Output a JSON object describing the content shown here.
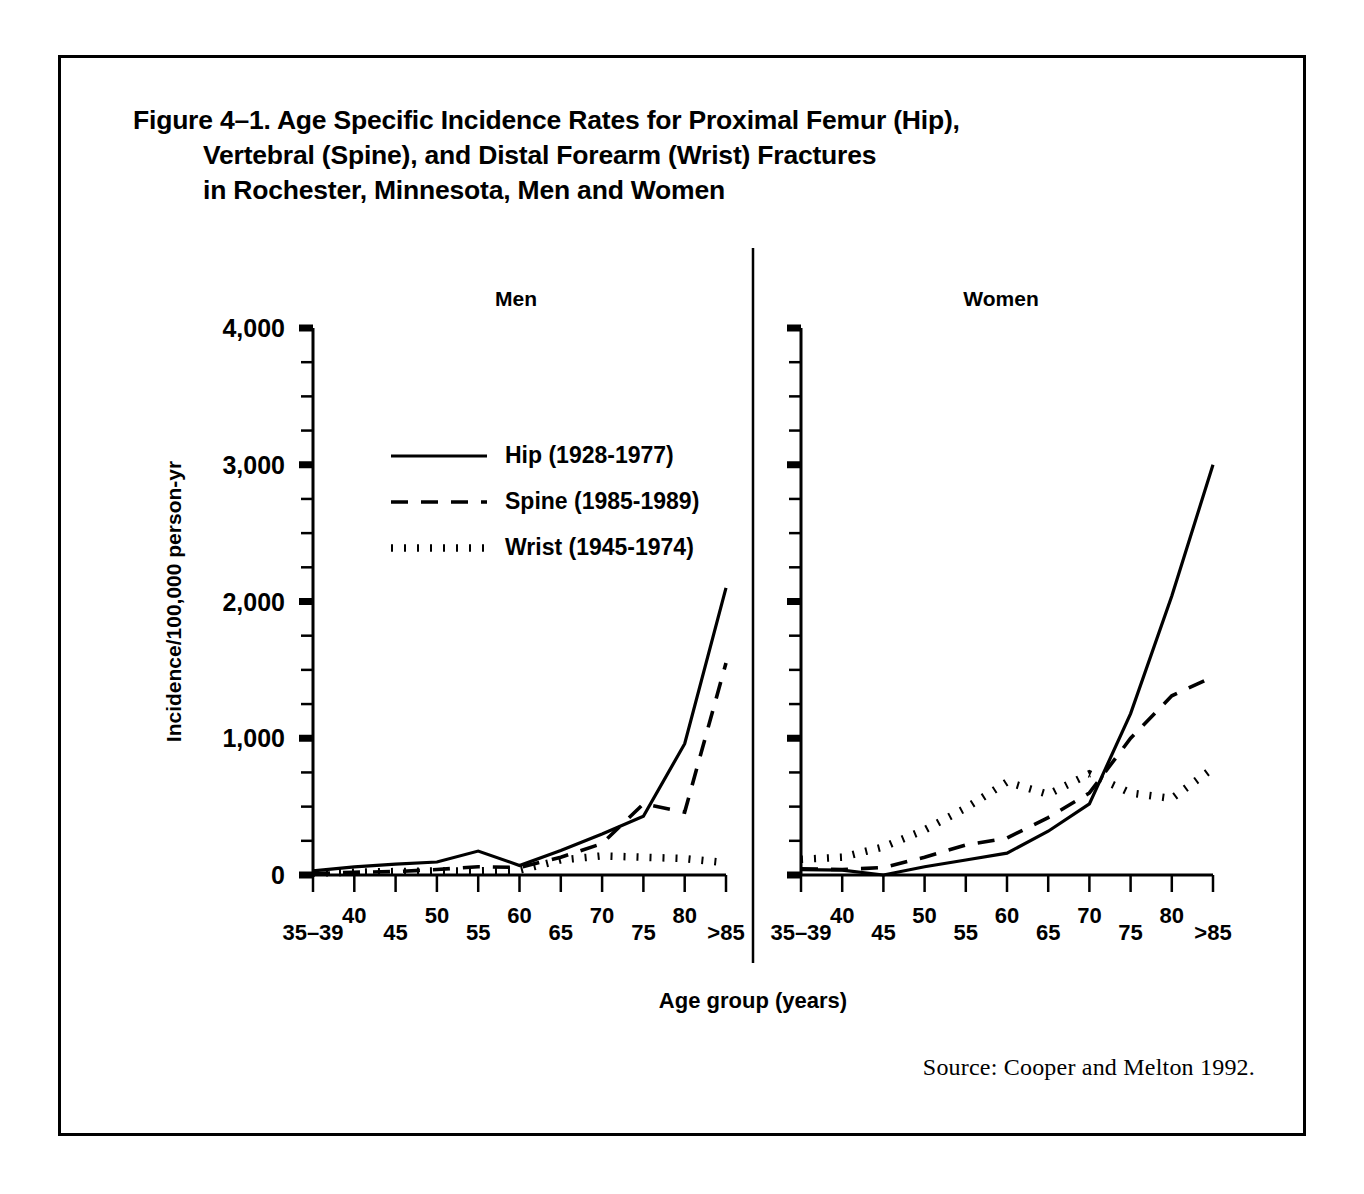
{
  "figure": {
    "title_lines": [
      "Figure 4–1. Age Specific Incidence Rates for Proximal Femur (Hip),",
      "Vertebral (Spine), and Distal Forearm (Wrist) Fractures",
      "in Rochester, Minnesota, Men and Women"
    ],
    "source": "Source: Cooper and Melton 1992."
  },
  "chart_data": {
    "type": "line",
    "title": "Figure 4–1. Age Specific Incidence Rates for Proximal Femur (Hip), Vertebral (Spine), and Distal Forearm (Wrist) Fractures in Rochester, Minnesota, Men and Women",
    "xlabel": "Age group (years)",
    "ylabel": "Incidence/100,000 person-yr",
    "categories": [
      "35–39",
      "40",
      "45",
      "50",
      "55",
      "60",
      "65",
      "70",
      "75",
      "80",
      ">85"
    ],
    "ylim": [
      0,
      4000
    ],
    "ytick_values": [
      0,
      1000,
      2000,
      3000,
      4000
    ],
    "ytick_labels": [
      "0",
      "1,000",
      "2,000",
      "3,000",
      "4,000"
    ],
    "yminor_step": 250,
    "grid": false,
    "legend_position": "upper-left-in-men-panel",
    "legend": [
      {
        "key": "hip",
        "label": "Hip (1928-1977)",
        "style": "solid"
      },
      {
        "key": "spine",
        "label": "Spine (1985-1989)",
        "style": "dashed"
      },
      {
        "key": "wrist",
        "label": "Wrist (1945-1974)",
        "style": "dotted"
      }
    ],
    "panels": [
      {
        "name": "men",
        "label": "Men",
        "series": [
          {
            "name": "Hip (1928-1977)",
            "key": "hip",
            "style": "solid",
            "values": [
              30,
              60,
              80,
              95,
              175,
              70,
              180,
              300,
              430,
              960,
              2100
            ]
          },
          {
            "name": "Spine (1985-1989)",
            "key": "spine",
            "style": "dashed",
            "values": [
              10,
              20,
              25,
              40,
              60,
              55,
              130,
              230,
              520,
              460,
              1550
            ]
          },
          {
            "name": "Wrist (1945-1974)",
            "key": "wrist",
            "style": "dotted",
            "values": [
              15,
              20,
              25,
              30,
              30,
              35,
              110,
              140,
              130,
              120,
              90
            ]
          }
        ]
      },
      {
        "name": "women",
        "label": "Women",
        "series": [
          {
            "name": "Hip (1928-1977)",
            "key": "hip",
            "style": "solid",
            "values": [
              40,
              35,
              0,
              60,
              110,
              160,
              320,
              520,
              1180,
              2040,
              3000
            ]
          },
          {
            "name": "Spine (1985-1989)",
            "key": "spine",
            "style": "dashed",
            "values": [
              45,
              40,
              55,
              130,
              220,
              270,
              420,
              600,
              1000,
              1310,
              1450
            ]
          },
          {
            "name": "Wrist (1945-1974)",
            "key": "wrist",
            "style": "dotted",
            "values": [
              115,
              130,
              205,
              330,
              490,
              680,
              590,
              740,
              600,
              560,
              780
            ]
          }
        ]
      }
    ]
  }
}
